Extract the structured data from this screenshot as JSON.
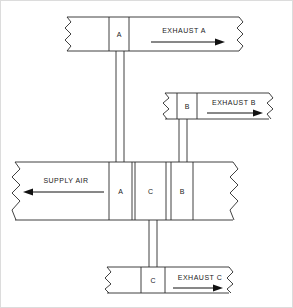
{
  "diagram": {
    "type": "hvac-ductwork-schematic",
    "colors": {
      "line": "#2b2b2b",
      "arrow": "#111111",
      "background": "#ffffff",
      "frame": "#dcdcdc"
    },
    "ducts": [
      {
        "id": "exhaust-a",
        "flow_label": "EXHAUST A",
        "flow_direction": "right",
        "damper_label": "A",
        "break_left": true,
        "break_right": true
      },
      {
        "id": "exhaust-b",
        "flow_label": "EXHAUST B",
        "flow_direction": "right",
        "damper_label": "B",
        "break_left": true,
        "break_right": true
      },
      {
        "id": "supply-air",
        "flow_label": "SUPPLY AIR",
        "flow_direction": "left",
        "damper_labels": [
          "A",
          "C",
          "B"
        ],
        "break_left": true,
        "break_right": true
      },
      {
        "id": "exhaust-c",
        "flow_label": "EXHAUST C",
        "flow_direction": "right",
        "damper_label": "C",
        "break_left": true,
        "break_right": true
      }
    ],
    "risers": [
      {
        "id": "riser-a",
        "from": "supply-air",
        "to": "exhaust-a",
        "label": "A"
      },
      {
        "id": "riser-b",
        "from": "supply-air",
        "to": "exhaust-b",
        "label": "B"
      },
      {
        "id": "riser-c",
        "from": "supply-air",
        "to": "exhaust-c",
        "label": "C"
      }
    ],
    "labels": {
      "exhaust_a": "EXHAUST A",
      "exhaust_b": "EXHAUST B",
      "exhaust_c": "EXHAUST C",
      "supply_air": "SUPPLY AIR",
      "damper_a_top": "A",
      "damper_b_mid": "B",
      "damper_a_supply": "A",
      "damper_c_supply": "C",
      "damper_b_supply": "B",
      "damper_c_bottom": "C"
    }
  }
}
